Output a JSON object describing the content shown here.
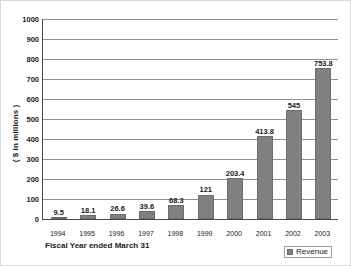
{
  "chart_data": {
    "type": "bar",
    "title": "",
    "categories": [
      "1994",
      "1995",
      "1996",
      "1997",
      "1998",
      "1999",
      "2000",
      "2001",
      "2002",
      "2003"
    ],
    "values": [
      9.5,
      18.1,
      26.6,
      39.6,
      68.3,
      121,
      203.4,
      413.8,
      545,
      753.8
    ],
    "value_labels": [
      "9.5",
      "18.1",
      "26.6",
      "39.6",
      "68.3",
      "121",
      "203.4",
      "413.8",
      "545",
      "753.8"
    ],
    "series": [
      {
        "name": "Revenue",
        "values": [
          9.5,
          18.1,
          26.6,
          39.6,
          68.3,
          121,
          203.4,
          413.8,
          545,
          753.8
        ],
        "color": "#808080"
      }
    ],
    "xlabel": "Fiscal Year ended March 31",
    "ylabel": "( $ in millions )",
    "ylim": [
      0,
      1000
    ],
    "ytick_step": 100,
    "ytick_labels": [
      "1000",
      "900",
      "800",
      "700",
      "600",
      "500",
      "400",
      "300",
      "200",
      "100",
      "0"
    ],
    "ytick_values": [
      1000,
      900,
      800,
      700,
      600,
      500,
      400,
      300,
      200,
      100,
      0
    ],
    "grid": "horizontal",
    "legend_position": "bottom-right",
    "legend": [
      {
        "label": "Revenue",
        "color": "#808080"
      }
    ],
    "colors": {
      "bar_fill": "#808080",
      "bar_edge": "#6b6b6b",
      "gridline": "#8f8f8f",
      "axis": "#4a4a4a",
      "text": "#1a1a1a",
      "background": "#ffffff"
    }
  }
}
